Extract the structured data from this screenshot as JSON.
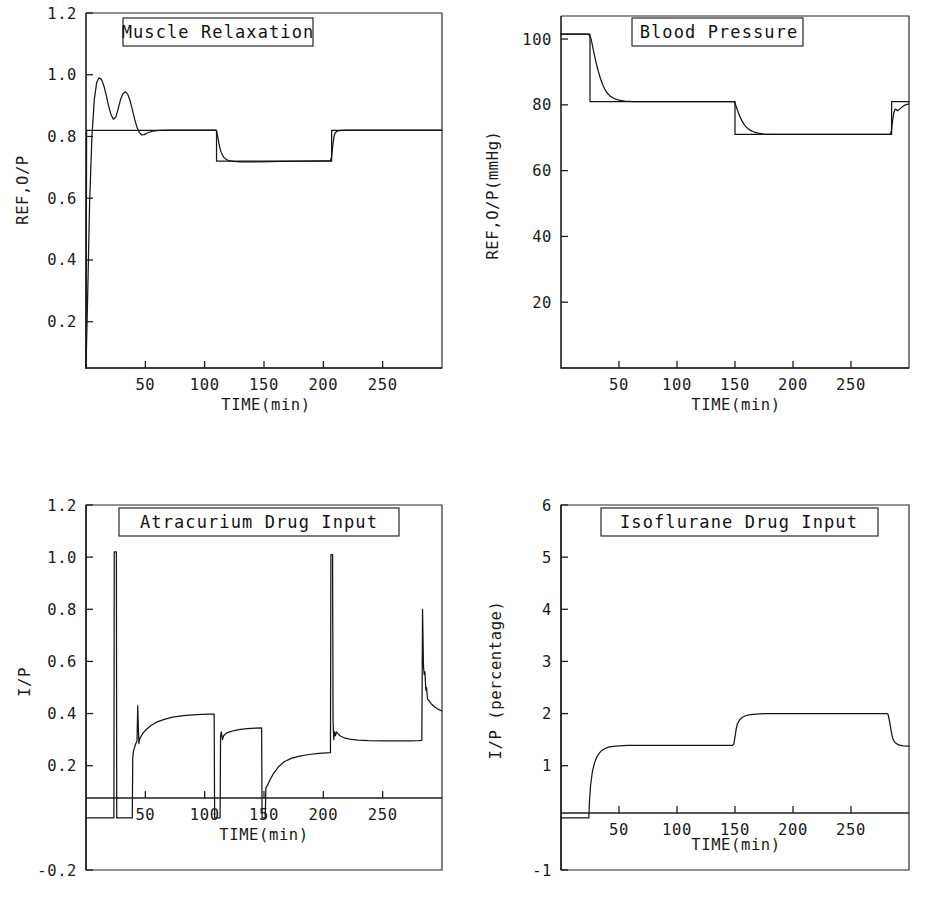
{
  "figure": {
    "name": "anaesthesia-closed-loop-simulation",
    "background": "#ffffff",
    "ink_color": "#161616",
    "width": 933,
    "height": 899
  },
  "common": {
    "xlabel": "TIME(min)",
    "x_ticks": [
      50,
      100,
      150,
      200,
      250
    ],
    "x_tick_labels": [
      "50",
      "100",
      "150",
      "200",
      "250"
    ],
    "xlim": [
      0,
      300
    ]
  },
  "chart_data": [
    {
      "id": "muscle-relaxation",
      "type": "line",
      "title": "Muscle Relaxation",
      "xlabel": "TIME(min)",
      "ylabel": "REF,O/P",
      "xlim": [
        0,
        300
      ],
      "ylim": [
        0.05,
        1.2
      ],
      "y_ticks": [
        0.2,
        0.4,
        0.6,
        0.8,
        1.0,
        1.2
      ],
      "y_tick_labels": [
        "0.2",
        "0.4",
        "0.6",
        "0.8",
        "1.0",
        "1.2"
      ],
      "grid": false,
      "legend": "none",
      "series": [
        {
          "name": "reference",
          "points": [
            [
              0,
              0.05
            ],
            [
              0.5,
              0.82
            ],
            [
              110,
              0.82
            ],
            [
              110,
              0.72
            ],
            [
              207,
              0.72
            ],
            [
              207,
              0.82
            ],
            [
              300,
              0.82
            ]
          ]
        },
        {
          "name": "output",
          "points": [
            [
              0,
              0.05
            ],
            [
              1.5,
              0.3
            ],
            [
              3,
              0.58
            ],
            [
              5,
              0.8
            ],
            [
              7,
              0.92
            ],
            [
              9,
              0.975
            ],
            [
              11,
              0.99
            ],
            [
              13,
              0.985
            ],
            [
              15,
              0.965
            ],
            [
              17,
              0.935
            ],
            [
              19,
              0.9
            ],
            [
              21,
              0.872
            ],
            [
              23,
              0.856
            ],
            [
              25,
              0.862
            ],
            [
              27,
              0.888
            ],
            [
              29,
              0.918
            ],
            [
              31,
              0.938
            ],
            [
              33,
              0.945
            ],
            [
              35,
              0.938
            ],
            [
              37,
              0.918
            ],
            [
              39,
              0.888
            ],
            [
              41,
              0.856
            ],
            [
              43,
              0.829
            ],
            [
              45,
              0.812
            ],
            [
              47,
              0.805
            ],
            [
              49,
              0.806
            ],
            [
              52,
              0.812
            ],
            [
              56,
              0.817
            ],
            [
              62,
              0.82
            ],
            [
              70,
              0.821
            ],
            [
              85,
              0.821
            ],
            [
              100,
              0.821
            ],
            [
              109,
              0.821
            ],
            [
              110,
              0.818
            ],
            [
              111,
              0.8
            ],
            [
              112,
              0.778
            ],
            [
              113,
              0.76
            ],
            [
              114,
              0.748
            ],
            [
              116,
              0.733
            ],
            [
              118,
              0.726
            ],
            [
              120,
              0.722
            ],
            [
              124,
              0.719
            ],
            [
              130,
              0.718
            ],
            [
              145,
              0.718
            ],
            [
              165,
              0.719
            ],
            [
              185,
              0.72
            ],
            [
              200,
              0.721
            ],
            [
              206,
              0.721
            ],
            [
              207,
              0.735
            ],
            [
              208,
              0.772
            ],
            [
              209,
              0.8
            ],
            [
              210,
              0.812
            ],
            [
              212,
              0.818
            ],
            [
              215,
              0.82
            ],
            [
              220,
              0.821
            ],
            [
              235,
              0.821
            ],
            [
              260,
              0.821
            ],
            [
              285,
              0.821
            ],
            [
              300,
              0.821
            ]
          ]
        }
      ]
    },
    {
      "id": "blood-pressure",
      "type": "line",
      "title": "Blood Pressure",
      "xlabel": "TIME(min)",
      "ylabel": "REF,O/P(mmHg)",
      "xlim": [
        0,
        300
      ],
      "ylim": [
        0,
        107
      ],
      "y_ticks": [
        20,
        40,
        60,
        80,
        100
      ],
      "y_tick_labels": [
        "20",
        "40",
        "60",
        "80",
        "100"
      ],
      "grid": false,
      "legend": "none",
      "series": [
        {
          "name": "reference",
          "points": [
            [
              0,
              101.5
            ],
            [
              25,
              101.5
            ],
            [
              25,
              81
            ],
            [
              150,
              81
            ],
            [
              150,
              71
            ],
            [
              285,
              71
            ],
            [
              285,
              81
            ],
            [
              300,
              81
            ]
          ]
        },
        {
          "name": "output",
          "points": [
            [
              0,
              101.5
            ],
            [
              20,
              101.5
            ],
            [
              24,
              101.4
            ],
            [
              26,
              100.0
            ],
            [
              28,
              96.5
            ],
            [
              30,
              93.2
            ],
            [
              32,
              90.4
            ],
            [
              34,
              88.0
            ],
            [
              36,
              86.1
            ],
            [
              38,
              84.6
            ],
            [
              40,
              83.5
            ],
            [
              43,
              82.5
            ],
            [
              46,
              81.9
            ],
            [
              50,
              81.4
            ],
            [
              55,
              81.1
            ],
            [
              62,
              81.0
            ],
            [
              75,
              81.0
            ],
            [
              95,
              81.0
            ],
            [
              120,
              81.0
            ],
            [
              145,
              81.0
            ],
            [
              149,
              81.0
            ],
            [
              150,
              80.6
            ],
            [
              152,
              78.5
            ],
            [
              154,
              76.6
            ],
            [
              156,
              75.1
            ],
            [
              158,
              74.0
            ],
            [
              160,
              73.1
            ],
            [
              163,
              72.3
            ],
            [
              166,
              71.8
            ],
            [
              170,
              71.4
            ],
            [
              175,
              71.1
            ],
            [
              182,
              71.0
            ],
            [
              195,
              71.0
            ],
            [
              215,
              71.0
            ],
            [
              240,
              71.0
            ],
            [
              265,
              71.0
            ],
            [
              280,
              71.0
            ],
            [
              284,
              71.0
            ],
            [
              285,
              72.5
            ],
            [
              286,
              75.6
            ],
            [
              287,
              77.7
            ],
            [
              288,
              78.7
            ],
            [
              289,
              78.6
            ],
            [
              290,
              78.2
            ],
            [
              291,
              78.4
            ],
            [
              293,
              79.0
            ],
            [
              295,
              79.6
            ],
            [
              297,
              80.0
            ],
            [
              300,
              80.3
            ]
          ]
        }
      ]
    },
    {
      "id": "atracurium-drug-input",
      "type": "line",
      "title": "Atracurium Drug Input",
      "xlabel": "TIME(min)",
      "ylabel": "I/P",
      "xlim": [
        0,
        300
      ],
      "ylim": [
        -0.2,
        1.2
      ],
      "y_ticks": [
        -0.2,
        0.2,
        0.4,
        0.6,
        0.8,
        1.0,
        1.2
      ],
      "y_tick_labels": [
        "-0.2",
        "0.2",
        "0.4",
        "0.6",
        "0.8",
        "1.0",
        "1.2"
      ],
      "grid": false,
      "legend": "none",
      "series": [
        {
          "name": "atracurium-input",
          "points": [
            [
              0,
              0
            ],
            [
              23.5,
              0
            ],
            [
              23.8,
              1.02
            ],
            [
              25.6,
              1.02
            ],
            [
              25.9,
              0
            ],
            [
              39,
              0
            ],
            [
              39.4,
              0.23
            ],
            [
              40,
              0.255
            ],
            [
              41,
              0.272
            ],
            [
              42,
              0.285
            ],
            [
              43,
              0.295
            ],
            [
              43.6,
              0.43
            ],
            [
              44.2,
              0.33
            ],
            [
              44.6,
              0.285
            ],
            [
              45,
              0.3
            ],
            [
              46,
              0.31
            ],
            [
              48,
              0.325
            ],
            [
              51,
              0.34
            ],
            [
              55,
              0.355
            ],
            [
              60,
              0.368
            ],
            [
              66,
              0.378
            ],
            [
              73,
              0.386
            ],
            [
              82,
              0.392
            ],
            [
              93,
              0.396
            ],
            [
              103,
              0.398
            ],
            [
              108,
              0.398
            ],
            [
              108.4,
              0
            ],
            [
              113,
              0
            ],
            [
              113.4,
              0.315
            ],
            [
              114,
              0.33
            ],
            [
              115,
              0.3
            ],
            [
              116,
              0.315
            ],
            [
              118,
              0.324
            ],
            [
              121,
              0.33
            ],
            [
              125,
              0.335
            ],
            [
              130,
              0.339
            ],
            [
              136,
              0.342
            ],
            [
              143,
              0.344
            ],
            [
              148,
              0.345
            ],
            [
              148.4,
              0
            ],
            [
              151,
              0
            ],
            [
              151.6,
              0.115
            ],
            [
              153,
              0.125
            ],
            [
              155,
              0.145
            ],
            [
              158,
              0.17
            ],
            [
              162,
              0.195
            ],
            [
              167,
              0.215
            ],
            [
              173,
              0.228
            ],
            [
              180,
              0.237
            ],
            [
              188,
              0.243
            ],
            [
              196,
              0.247
            ],
            [
              203,
              0.249
            ],
            [
              206,
              0.25
            ],
            [
              206.4,
              1.01
            ],
            [
              207.8,
              1.01
            ],
            [
              208.2,
              0.37
            ],
            [
              208.8,
              0.3
            ],
            [
              209.4,
              0.33
            ],
            [
              210.2,
              0.315
            ],
            [
              211,
              0.33
            ],
            [
              212,
              0.325
            ],
            [
              214,
              0.315
            ],
            [
              217,
              0.308
            ],
            [
              222,
              0.302
            ],
            [
              229,
              0.298
            ],
            [
              238,
              0.296
            ],
            [
              250,
              0.295
            ],
            [
              262,
              0.295
            ],
            [
              272,
              0.295
            ],
            [
              280,
              0.296
            ],
            [
              283,
              0.297
            ],
            [
              283.6,
              0.8
            ],
            [
              284.4,
              0.58
            ],
            [
              285,
              0.55
            ],
            [
              285.6,
              0.56
            ],
            [
              286.4,
              0.49
            ],
            [
              287,
              0.5
            ],
            [
              287.8,
              0.455
            ],
            [
              289,
              0.45
            ],
            [
              291,
              0.437
            ],
            [
              294,
              0.425
            ],
            [
              297,
              0.416
            ],
            [
              300,
              0.41
            ]
          ]
        }
      ]
    },
    {
      "id": "isoflurane-drug-input",
      "type": "line",
      "title": "Isoflurane Drug Input",
      "xlabel": "TIME(min)",
      "ylabel": "I/P (percentage)",
      "xlim": [
        0,
        300
      ],
      "ylim": [
        -1,
        6
      ],
      "y_ticks": [
        -1,
        1,
        2,
        3,
        4,
        5,
        6
      ],
      "y_tick_labels": [
        "-1",
        "1",
        "2",
        "3",
        "4",
        "5",
        "6"
      ],
      "grid": false,
      "legend": "none",
      "series": [
        {
          "name": "isoflurane-input",
          "points": [
            [
              0,
              0
            ],
            [
              24,
              0
            ],
            [
              24.5,
              0.3
            ],
            [
              25.5,
              0.62
            ],
            [
              27,
              0.88
            ],
            [
              29,
              1.06
            ],
            [
              31,
              1.17
            ],
            [
              33,
              1.24
            ],
            [
              35,
              1.29
            ],
            [
              38,
              1.33
            ],
            [
              41,
              1.355
            ],
            [
              45,
              1.372
            ],
            [
              50,
              1.382
            ],
            [
              58,
              1.388
            ],
            [
              70,
              1.39
            ],
            [
              90,
              1.39
            ],
            [
              115,
              1.39
            ],
            [
              140,
              1.39
            ],
            [
              148,
              1.39
            ],
            [
              149,
              1.42
            ],
            [
              150,
              1.55
            ],
            [
              151,
              1.7
            ],
            [
              152,
              1.8
            ],
            [
              154,
              1.88
            ],
            [
              156,
              1.925
            ],
            [
              159,
              1.958
            ],
            [
              163,
              1.978
            ],
            [
              168,
              1.99
            ],
            [
              175,
              1.998
            ],
            [
              185,
              2.0
            ],
            [
              200,
              2.0
            ],
            [
              225,
              2.0
            ],
            [
              250,
              2.0
            ],
            [
              270,
              2.0
            ],
            [
              281,
              2.0
            ],
            [
              282,
              1.98
            ],
            [
              283,
              1.88
            ],
            [
              284,
              1.75
            ],
            [
              285,
              1.62
            ],
            [
              286,
              1.52
            ],
            [
              288,
              1.44
            ],
            [
              291,
              1.4
            ],
            [
              295,
              1.382
            ],
            [
              300,
              1.375
            ]
          ]
        }
      ]
    }
  ]
}
